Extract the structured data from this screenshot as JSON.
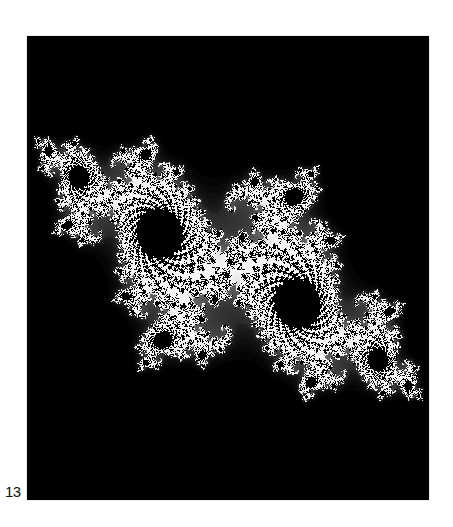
{
  "figure": {
    "number_label": "13",
    "panel": {
      "background": "#000000",
      "x": 27,
      "y": 36,
      "width": 402,
      "height": 464
    },
    "colors": {
      "core": "#f2f2f2",
      "arms": "#4a4a4a",
      "background": "#000000"
    },
    "render": {
      "c_re": -0.7269,
      "c_im": 0.1889,
      "center_re": 0.0,
      "center_im": 0.0,
      "scale": 2.55,
      "rotation_deg": -38,
      "max_iter": 220
    }
  }
}
